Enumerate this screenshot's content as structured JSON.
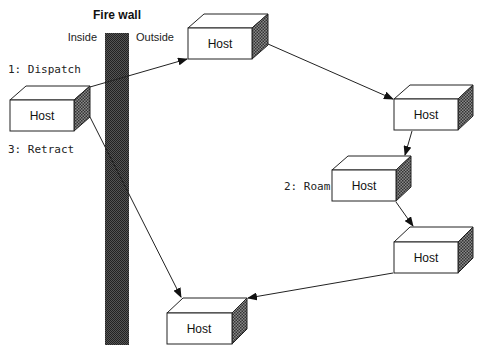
{
  "diagram": {
    "firewall": {
      "title": "Fire wall",
      "inside_label": "Inside",
      "outside_label": "Outside"
    },
    "steps": {
      "dispatch": "1: Dispatch",
      "roam": "2: Roam",
      "retract": "3: Retract"
    },
    "hosts": [
      {
        "id": "origin",
        "label": "Host"
      },
      {
        "id": "outside-1",
        "label": "Host"
      },
      {
        "id": "outside-2",
        "label": "Host"
      },
      {
        "id": "outside-3",
        "label": "Host"
      },
      {
        "id": "outside-4",
        "label": "Host"
      },
      {
        "id": "outside-5",
        "label": "Host"
      }
    ],
    "colors": {
      "stroke": "#222222",
      "shade": "#555555",
      "firewall": "#3a3a3a"
    }
  }
}
